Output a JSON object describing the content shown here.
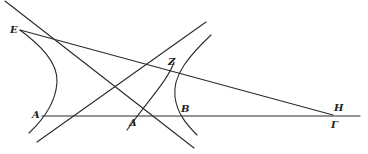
{
  "figure": {
    "type": "geometric-diagram",
    "colors": {
      "stroke": "#2a2a2a",
      "background": "#ffffff"
    },
    "labels": {
      "E": "E",
      "Z": "Z",
      "A": "A",
      "Delta": "Δ",
      "B": "B",
      "H": "H",
      "Gamma": "Γ"
    },
    "points": {
      "E": [
        20,
        30
      ],
      "Z": [
        172,
        67
      ],
      "A": [
        44,
        116
      ],
      "Delta": [
        136,
        116
      ],
      "B": [
        180,
        116
      ],
      "H": [
        333,
        115
      ],
      "Gamma": [
        333,
        116
      ]
    },
    "elements": [
      {
        "kind": "line",
        "name": "baseline",
        "from": "A",
        "to": "beyond-Gamma"
      },
      {
        "kind": "line",
        "name": "transversal-E-H",
        "from": "E",
        "to": "H"
      },
      {
        "kind": "line",
        "name": "diagonal-descending"
      },
      {
        "kind": "line",
        "name": "diagonal-ascending"
      },
      {
        "kind": "curve",
        "name": "hyperbola-left-branch",
        "vertex": "A"
      },
      {
        "kind": "curve",
        "name": "hyperbola-right-branch",
        "vertex": "B"
      },
      {
        "kind": "curve",
        "name": "curve-Z-Delta"
      }
    ]
  }
}
